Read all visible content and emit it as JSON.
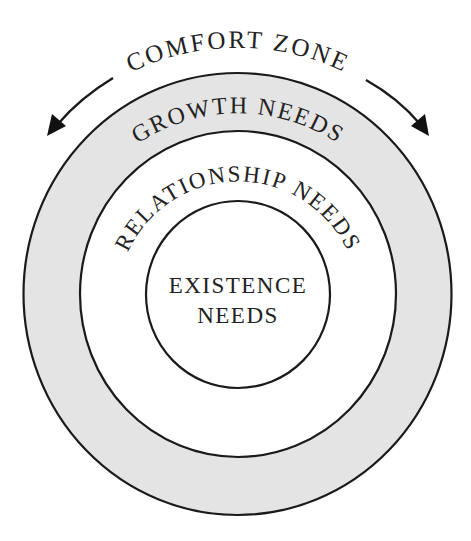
{
  "diagram": {
    "comfort_zone": {
      "label": "COMFORT ZONE",
      "arrows": [
        "left-arrow",
        "right-arrow"
      ]
    },
    "rings": [
      {
        "id": "outer",
        "label": "GROWTH NEEDS",
        "fill": "#e4e4e4"
      },
      {
        "id": "middle",
        "label": "RELATIONSHIP NEEDS",
        "fill": "#ffffff"
      },
      {
        "id": "inner",
        "label_line1": "EXISTENCE",
        "label_line2": "NEEDS",
        "fill": "#ffffff"
      }
    ],
    "colors": {
      "stroke": "#1a1a1a",
      "text": "#222222",
      "background": "#ffffff",
      "shaded_ring": "#e4e4e4"
    }
  }
}
